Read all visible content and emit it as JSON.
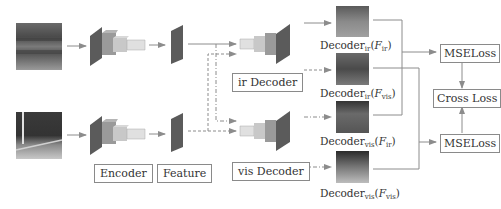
{
  "diagram": {
    "labels": {
      "encoder": "Encoder",
      "feature": "Feature",
      "ir_decoder": "ir Decoder",
      "vis_decoder": "vis Decoder",
      "mse_loss_top": "MSELoss",
      "mse_loss_bottom": "MSELoss",
      "cross_loss": "Cross Loss"
    },
    "outputs": [
      {
        "base": "Decoder",
        "sub": "ir",
        "arg": "F",
        "arg_sub": "ir"
      },
      {
        "base": "Decoder",
        "sub": "ir",
        "arg": "F",
        "arg_sub": "vis"
      },
      {
        "base": "Decoder",
        "sub": "vis",
        "arg": "F",
        "arg_sub": "ir"
      },
      {
        "base": "Decoder",
        "sub": "vis",
        "arg": "F",
        "arg_sub": "vis"
      }
    ],
    "inputs": [
      {
        "name": "infrared-image"
      },
      {
        "name": "visible-image"
      }
    ],
    "colors": {
      "line": "#8c8c8c",
      "box_border": "#8a8a8a",
      "block_dark": "#5b5b5b",
      "block_mid": "#9a9a9a",
      "block_light": "#c8c8c8",
      "block_lighter": "#e0e0e0"
    }
  }
}
